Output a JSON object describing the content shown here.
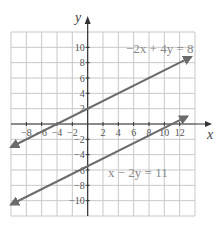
{
  "chart_data": {
    "type": "line",
    "title": "",
    "xlabel": "x",
    "ylabel": "y",
    "xlim": [
      -10,
      14
    ],
    "ylim": [
      -12,
      12
    ],
    "grid": true,
    "grid_step": 2,
    "x_ticks": [
      "-8",
      "-6",
      "-4",
      "-2",
      "2",
      "4",
      "6",
      "8",
      "10",
      "12"
    ],
    "y_ticks": [
      "10",
      "8",
      "6",
      "4",
      "2",
      "-2",
      "-4",
      "-6",
      "-8",
      "-10"
    ],
    "series": [
      {
        "name": "-2x + 4y = 8",
        "equation": "y = 0.5x + 2",
        "x": [
          -10,
          13.5
        ],
        "y": [
          -3,
          8.75
        ],
        "arrows": "both",
        "label_position": "top-right"
      },
      {
        "name": "x - 2y = 11",
        "equation": "y = 0.5x - 5.5",
        "x": [
          -10,
          13
        ],
        "y": [
          -10.5,
          1
        ],
        "arrows": "both",
        "label_position": "middle-right"
      }
    ],
    "colors": {
      "line": "#6b6b6b",
      "grid": "#c8c8c8",
      "axis": "#333333"
    }
  },
  "labels": {
    "x_axis": "x",
    "y_axis": "y",
    "eq1": "−2x + 4y = 8",
    "eq2": "x − 2y = 11"
  }
}
